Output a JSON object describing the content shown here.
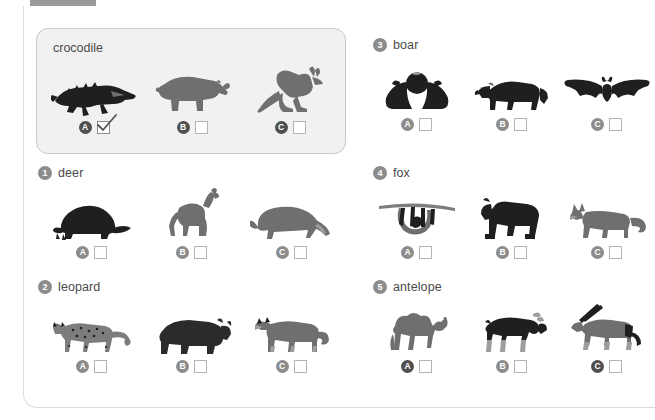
{
  "worksheet": {
    "title_tab": "",
    "example": {
      "label": "crocodile",
      "options": [
        {
          "letter": "A",
          "animal": "crocodile-silhouette",
          "checked": true
        },
        {
          "letter": "B",
          "animal": "rhinoceros-silhouette",
          "checked": false
        },
        {
          "letter": "C",
          "animal": "kangaroo-silhouette",
          "checked": false
        }
      ]
    },
    "questions": [
      {
        "number": "1",
        "label": "deer",
        "options": [
          {
            "letter": "A",
            "animal": "porcupine-silhouette",
            "checked": false
          },
          {
            "letter": "B",
            "animal": "deer-silhouette",
            "checked": false
          },
          {
            "letter": "C",
            "animal": "anteater-silhouette",
            "checked": false
          }
        ]
      },
      {
        "number": "2",
        "label": "leopard",
        "options": [
          {
            "letter": "A",
            "animal": "leopard-silhouette",
            "checked": false
          },
          {
            "letter": "B",
            "animal": "bear-silhouette",
            "checked": false
          },
          {
            "letter": "C",
            "animal": "wolf-silhouette",
            "checked": false
          }
        ]
      },
      {
        "number": "3",
        "label": "boar",
        "options": [
          {
            "letter": "A",
            "animal": "bat-hanging-silhouette",
            "checked": false
          },
          {
            "letter": "B",
            "animal": "boar-silhouette",
            "checked": false
          },
          {
            "letter": "C",
            "animal": "bat-flying-silhouette",
            "checked": false
          }
        ]
      },
      {
        "number": "4",
        "label": "fox",
        "options": [
          {
            "letter": "A",
            "animal": "sloth-silhouette",
            "checked": false
          },
          {
            "letter": "B",
            "animal": "gorilla-silhouette",
            "checked": false
          },
          {
            "letter": "C",
            "animal": "fox-silhouette",
            "checked": false
          }
        ]
      },
      {
        "number": "5",
        "label": "antelope",
        "options": [
          {
            "letter": "A",
            "animal": "camel-silhouette",
            "checked": false
          },
          {
            "letter": "B",
            "animal": "moose-silhouette",
            "checked": false
          },
          {
            "letter": "C",
            "animal": "oryx-antelope-silhouette",
            "checked": false
          }
        ]
      }
    ]
  },
  "colors": {
    "tab": "#9a9a9a",
    "example_fill": "#f1f1f1",
    "example_border": "#c9c9c9",
    "badge": "#8c8c8c",
    "letter_badge": "#4f4f4f",
    "checkbox_border": "#b4b4b4",
    "text": "#4a4a4a",
    "sheet_border": "#dcdcdc"
  }
}
